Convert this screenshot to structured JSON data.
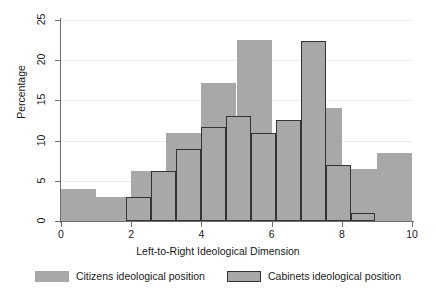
{
  "chart_data": {
    "type": "bar",
    "title": "",
    "xlabel": "Left-to-Right Ideological Dimension",
    "ylabel": "Percentage",
    "xlim": [
      0,
      10
    ],
    "ylim": [
      0,
      25
    ],
    "xticks": [
      0,
      2,
      4,
      6,
      8,
      10
    ],
    "yticks": [
      0,
      5,
      10,
      15,
      20,
      25
    ],
    "grid": "horizontal",
    "legend_position": "bottom",
    "series": [
      {
        "name": "Citizens ideological position",
        "style": "filled-no-border",
        "color": "#a8a8a8",
        "bin_width": 1.0,
        "bins": [
          {
            "x0": 0,
            "x1": 1,
            "value": 4.0
          },
          {
            "x0": 1,
            "x1": 2,
            "value": 3.0
          },
          {
            "x0": 2,
            "x1": 3,
            "value": 6.2
          },
          {
            "x0": 3,
            "x1": 4,
            "value": 11.0
          },
          {
            "x0": 4,
            "x1": 5,
            "value": 17.2
          },
          {
            "x0": 5,
            "x1": 6,
            "value": 22.5
          },
          {
            "x0": 6,
            "x1": 7,
            "value": 11.0
          },
          {
            "x0": 7,
            "x1": 8,
            "value": 14.0
          },
          {
            "x0": 8,
            "x1": 9,
            "value": 6.5
          },
          {
            "x0": 9,
            "x1": 10,
            "value": 8.5
          }
        ]
      },
      {
        "name": "Cabinets ideological position",
        "style": "filled-dark-border",
        "color": "#a8a8a8",
        "border_color": "#333333",
        "bin_width": 0.71,
        "bins": [
          {
            "x0": 1.86,
            "x1": 2.57,
            "value": 3.0
          },
          {
            "x0": 2.57,
            "x1": 3.28,
            "value": 6.2
          },
          {
            "x0": 3.28,
            "x1": 3.99,
            "value": 9.0
          },
          {
            "x0": 3.99,
            "x1": 4.7,
            "value": 11.7
          },
          {
            "x0": 4.7,
            "x1": 5.41,
            "value": 13.0
          },
          {
            "x0": 5.41,
            "x1": 6.12,
            "value": 11.0
          },
          {
            "x0": 6.12,
            "x1": 6.83,
            "value": 12.6
          },
          {
            "x0": 6.83,
            "x1": 7.54,
            "value": 22.4
          },
          {
            "x0": 7.54,
            "x1": 8.25,
            "value": 7.0
          },
          {
            "x0": 8.25,
            "x1": 8.96,
            "value": 1.0
          }
        ]
      }
    ],
    "legend": [
      {
        "label": "Citizens ideological position",
        "swatch": "plain"
      },
      {
        "label": "Cabinets ideological position",
        "swatch": "bordered"
      }
    ]
  },
  "colors": {
    "bar_fill": "#a8a8a8",
    "bar_border": "#333333",
    "axis": "#6f6f6f",
    "grid": "#eceaea",
    "background": "#ffffff",
    "text": "#1a1a1a"
  }
}
